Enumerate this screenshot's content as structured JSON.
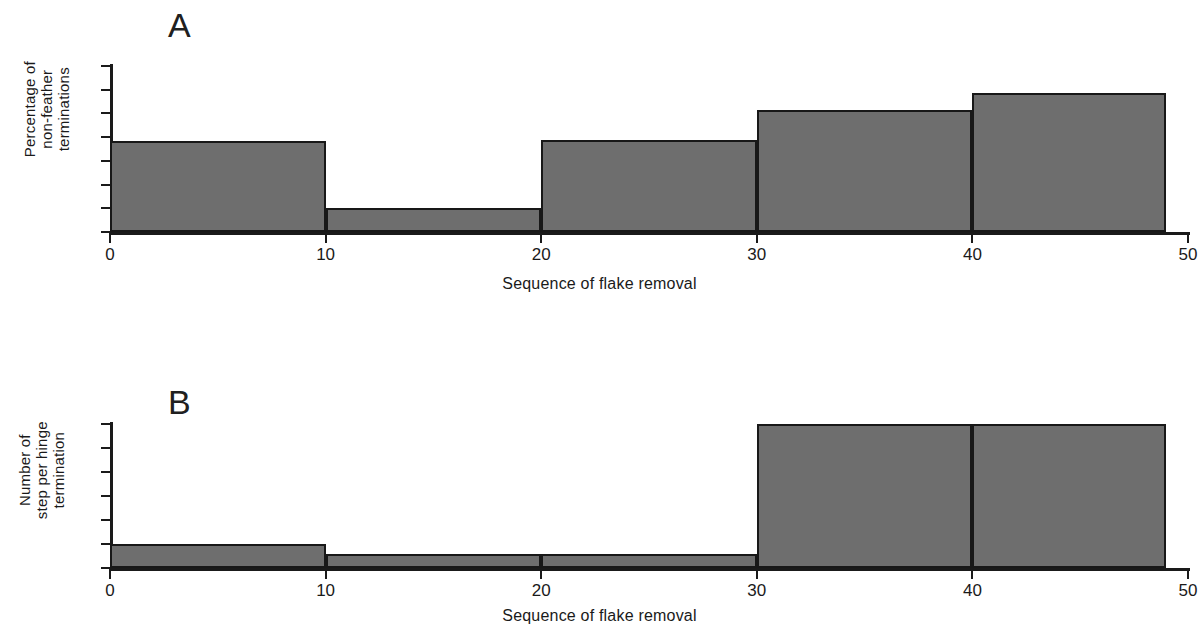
{
  "figure": {
    "background": "#ffffff",
    "bar_fill": "#6e6e6e",
    "bar_stroke": "#181818",
    "axis_color": "#1a1a1a"
  },
  "panels": [
    {
      "letter": "A",
      "ylabel": "Percentage of\nnon-feather\nterminations",
      "xlabel": "Sequence of flake removal"
    },
    {
      "letter": "B",
      "ylabel": "Number of\nstep per hinge\ntermination",
      "xlabel": "Sequence of flake removal"
    }
  ],
  "chart_data": [
    {
      "type": "bar",
      "title": "A",
      "xlabel": "Sequence of flake removal",
      "ylabel": "Percentage of non-feather terminations",
      "bin_edges": [
        0,
        10,
        20,
        30,
        40,
        49
      ],
      "categories": [
        "0-10",
        "10-20",
        "20-30",
        "30-40",
        "40-49"
      ],
      "values": [
        38.5,
        10,
        39,
        51.5,
        58.5
      ],
      "xlim": [
        0,
        50
      ],
      "ylim": [
        0,
        70
      ],
      "xticks": [
        0,
        10,
        20,
        30,
        40,
        50
      ],
      "yticks": [
        0,
        10,
        20,
        30,
        40,
        50,
        60,
        70
      ],
      "xtick_labels": [
        "0",
        "10",
        "20",
        "30",
        "40",
        "50"
      ],
      "ytick_labels": [
        "0",
        "10",
        "20",
        "30",
        "40",
        "50",
        "60",
        "70"
      ],
      "grid": false,
      "legend": false
    },
    {
      "type": "bar",
      "title": "B",
      "xlabel": "Sequence of flake removal",
      "ylabel": "Number of step per hinge termination",
      "bin_edges": [
        0,
        10,
        20,
        30,
        40,
        49
      ],
      "categories": [
        "0-10",
        "10-20",
        "20-30",
        "30-40",
        "40-49"
      ],
      "values": [
        1.0,
        0.58,
        0.58,
        6.0,
        6.0
      ],
      "xlim": [
        0,
        50
      ],
      "ylim": [
        0,
        6
      ],
      "xticks": [
        0,
        10,
        20,
        30,
        40,
        50
      ],
      "yticks": [
        0,
        1,
        2,
        3,
        4,
        5,
        6
      ],
      "xtick_labels": [
        "0",
        "10",
        "20",
        "30",
        "40",
        "50"
      ],
      "ytick_labels": [
        "0",
        "1",
        "2",
        "3",
        "4",
        "5",
        "6"
      ],
      "grid": false,
      "legend": false
    }
  ]
}
